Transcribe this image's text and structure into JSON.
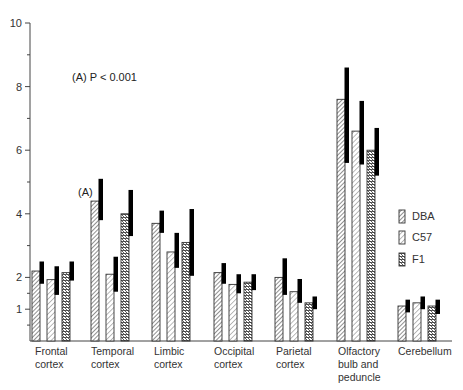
{
  "chart_data": {
    "type": "bar",
    "title": "",
    "xlabel": "",
    "ylabel": "",
    "ylim": [
      0,
      10
    ],
    "yticks": [
      1,
      2,
      4,
      6,
      8,
      10
    ],
    "yticks_minor": [
      3,
      5,
      7,
      9
    ],
    "grid": false,
    "annotation": "(A) P < 0.001",
    "marker_label": "(A)",
    "categories": [
      "Frontal cortex",
      "Temporal cortex",
      "Limbic cortex",
      "Occipital cortex",
      "Parietal cortex",
      "Olfactory bulb and peduncle",
      "Cerebellum"
    ],
    "category_lines": [
      [
        "Frontal",
        "cortex"
      ],
      [
        "Temporal",
        "cortex"
      ],
      [
        "Limbic",
        "cortex"
      ],
      [
        "Occipital",
        "cortex"
      ],
      [
        "Parietal",
        "cortex"
      ],
      [
        "Olfactory",
        "bulb and",
        "peduncle"
      ],
      [
        "Cerebellum"
      ]
    ],
    "series": [
      {
        "name": "DBA",
        "pattern": "diag",
        "values": [
          2.2,
          4.4,
          3.7,
          2.15,
          2.0,
          7.6,
          1.1
        ],
        "err_high": [
          2.5,
          5.1,
          4.1,
          2.45,
          2.6,
          8.6,
          1.3
        ],
        "err_low": [
          1.8,
          3.8,
          3.4,
          1.8,
          1.45,
          5.6,
          0.9
        ]
      },
      {
        "name": "C57",
        "pattern": "diag-light",
        "values": [
          1.93,
          2.1,
          2.8,
          1.78,
          1.55,
          6.6,
          1.2
        ],
        "err_high": [
          2.35,
          2.65,
          3.4,
          2.1,
          1.95,
          7.55,
          1.4
        ],
        "err_low": [
          1.45,
          1.55,
          2.3,
          1.5,
          1.2,
          5.55,
          1.0
        ]
      },
      {
        "name": "F1",
        "pattern": "cross",
        "values": [
          2.15,
          4.0,
          3.1,
          1.85,
          1.2,
          6.0,
          1.1
        ],
        "err_high": [
          2.5,
          4.75,
          4.15,
          2.1,
          1.4,
          6.7,
          1.3
        ],
        "err_low": [
          1.9,
          3.3,
          2.05,
          1.6,
          1.0,
          5.2,
          0.85
        ]
      }
    ],
    "legend": {
      "position": "right",
      "entries": [
        "DBA",
        "C57",
        "F1"
      ]
    }
  }
}
